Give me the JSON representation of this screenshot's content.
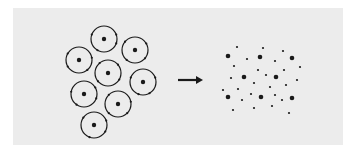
{
  "diagram": {
    "colors": {
      "background": "#ffffff",
      "panel": "#ececec",
      "ink": "#1a1a1a"
    },
    "atom_radius": 13,
    "atoms": [
      {
        "cx": 104,
        "cy": 39,
        "electrons": [
          200,
          340,
          20,
          120
        ]
      },
      {
        "cx": 135,
        "cy": 50,
        "electrons": [
          220,
          330,
          40,
          130
        ]
      },
      {
        "cx": 79,
        "cy": 60,
        "electrons": [
          210,
          350,
          50,
          150
        ]
      },
      {
        "cx": 108,
        "cy": 73,
        "electrons": [
          230,
          320,
          30,
          140
        ]
      },
      {
        "cx": 143,
        "cy": 82,
        "electrons": [
          200,
          340,
          60,
          110
        ]
      },
      {
        "cx": 84,
        "cy": 94,
        "electrons": [
          190,
          330,
          20,
          125
        ]
      },
      {
        "cx": 118,
        "cy": 104,
        "electrons": [
          225,
          350,
          45,
          135
        ]
      },
      {
        "cx": 94,
        "cy": 125,
        "electrons": [
          215,
          340,
          30,
          110
        ]
      }
    ],
    "arrow": {
      "x1": 178,
      "y1": 80,
      "x2": 203,
      "y2": 80,
      "label": "transforms-to"
    },
    "nuclei": [
      [
        228,
        56
      ],
      [
        260,
        57
      ],
      [
        292,
        58
      ],
      [
        244,
        77
      ],
      [
        276,
        77
      ],
      [
        228,
        97
      ],
      [
        261,
        97
      ],
      [
        292,
        98
      ]
    ],
    "free_electrons": [
      [
        237,
        47
      ],
      [
        263,
        48
      ],
      [
        283,
        51
      ],
      [
        247,
        59
      ],
      [
        275,
        61
      ],
      [
        234,
        66
      ],
      [
        300,
        67
      ],
      [
        258,
        70
      ],
      [
        284,
        70
      ],
      [
        231,
        78
      ],
      [
        266,
        75
      ],
      [
        297,
        80
      ],
      [
        254,
        83
      ],
      [
        286,
        85
      ],
      [
        238,
        89
      ],
      [
        270,
        87
      ],
      [
        223,
        90
      ],
      [
        251,
        94
      ],
      [
        275,
        95
      ],
      [
        242,
        100
      ],
      [
        282,
        100
      ],
      [
        233,
        110
      ],
      [
        254,
        108
      ],
      [
        272,
        106
      ],
      [
        289,
        113
      ]
    ]
  }
}
